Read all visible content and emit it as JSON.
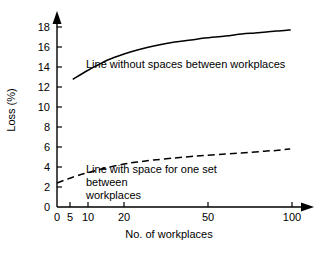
{
  "chart_data": {
    "type": "line",
    "title": "",
    "xlabel": "No. of workplaces",
    "ylabel": "Loss (%)",
    "xscale": "log",
    "xlim": [
      4,
      105
    ],
    "ylim": [
      0,
      18
    ],
    "grid": false,
    "legend_position": "inline-annotations",
    "xticks": [
      "0",
      "5",
      "10",
      "20",
      "50",
      "100"
    ],
    "xtick_values": [
      0,
      5,
      10,
      20,
      50,
      100
    ],
    "yticks": [
      "0",
      "2",
      "4",
      "6",
      "8",
      "10",
      "12",
      "14",
      "16",
      "18"
    ],
    "ytick_values": [
      0,
      2,
      4,
      6,
      8,
      10,
      12,
      14,
      16,
      18
    ],
    "series": [
      {
        "name": "Line without spaces between workplaces",
        "style": "solid",
        "color": "#000000",
        "x": [
          5,
          6,
          7,
          8,
          10,
          12,
          15,
          20,
          25,
          30,
          40,
          50,
          60,
          70,
          80,
          90,
          97
        ],
        "values": [
          12.8,
          13.6,
          14.2,
          14.7,
          15.3,
          15.7,
          16.1,
          16.5,
          16.7,
          16.9,
          17.1,
          17.3,
          17.4,
          17.5,
          17.6,
          17.65,
          17.7
        ]
      },
      {
        "name": "Line with space for one set between workplaces",
        "style": "dashed",
        "color": "#000000",
        "x": [
          4,
          5,
          6,
          7,
          8,
          10,
          12,
          15,
          20,
          25,
          30,
          40,
          50,
          60,
          70,
          80,
          90,
          97
        ],
        "values": [
          2.4,
          3.0,
          3.4,
          3.7,
          3.95,
          4.3,
          4.5,
          4.7,
          4.9,
          5.05,
          5.15,
          5.3,
          5.4,
          5.5,
          5.6,
          5.65,
          5.75,
          5.8
        ]
      }
    ],
    "annotations": [
      {
        "text": "Line without spaces between workplaces",
        "refers_to": "solid"
      },
      {
        "text": "Line with space for one set between workplaces",
        "refers_to": "dashed"
      }
    ]
  },
  "axis": {
    "ylabel": "Loss (%)",
    "xlabel": "No. of workplaces",
    "ytick_labels": [
      "18",
      "16",
      "14",
      "12",
      "10",
      "8",
      "6",
      "4",
      "2",
      "0"
    ],
    "xtick_labels": [
      "0",
      "5",
      "10",
      "20",
      "50",
      "100"
    ]
  },
  "annotations": {
    "solid": "Line without spaces between workplaces",
    "dashed_line1": "Line with space for one set between",
    "dashed_line2": "workplaces"
  }
}
